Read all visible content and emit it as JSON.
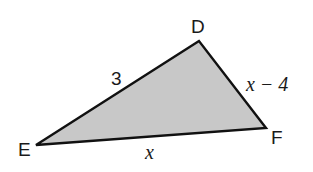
{
  "diagram": {
    "type": "triangle",
    "fill_color": "#c8c8c8",
    "stroke_color": "#111111",
    "vertices": [
      {
        "name": "D",
        "x": 199,
        "y": 41
      },
      {
        "name": "E",
        "x": 36,
        "y": 145
      },
      {
        "name": "F",
        "x": 266,
        "y": 128
      }
    ],
    "vertex_labels": {
      "D": "D",
      "E": "E",
      "F": "F"
    },
    "side_labels": {
      "DE": "3",
      "DF": "x − 4",
      "EF": "x"
    }
  }
}
